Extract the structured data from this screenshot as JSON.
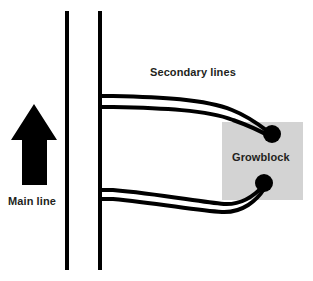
{
  "diagram": {
    "background_color": "#ffffff",
    "line_color": "#000000",
    "text_color": "#231f20",
    "labels": {
      "main_line": "Main line",
      "secondary_lines": "Secondary lines",
      "growblock": "Growblock"
    },
    "growblock": {
      "label": "Growblock",
      "fill_color": "#d3d3d3",
      "x": 222,
      "y": 122,
      "width": 81,
      "height": 78
    },
    "flow_arrow": {
      "direction": "up",
      "color": "#000000",
      "apex_x": 34,
      "apex_y": 104,
      "base_y": 185
    },
    "main_lines": [
      {
        "name": "main-line-left",
        "x": 67,
        "y_top": 11,
        "y_bottom": 270
      },
      {
        "name": "main-line-right",
        "x": 100,
        "y_top": 11,
        "y_bottom": 270
      }
    ],
    "secondary_lines": [
      {
        "name": "secondary-line-upper-outer",
        "branch_y": 96,
        "emitter": "emitter-upper"
      },
      {
        "name": "secondary-line-upper-inner",
        "branch_y": 107,
        "emitter": "emitter-upper"
      },
      {
        "name": "secondary-line-lower-outer",
        "branch_y": 190,
        "emitter": "emitter-lower"
      },
      {
        "name": "secondary-line-lower-inner",
        "branch_y": 199,
        "emitter": "emitter-lower"
      }
    ],
    "emitters": [
      {
        "name": "emitter-upper",
        "cx": 272,
        "cy": 134,
        "r": 9
      },
      {
        "name": "emitter-lower",
        "cx": 264,
        "cy": 183,
        "r": 9
      }
    ],
    "label_positions": {
      "main_line": {
        "x": 8,
        "y": 205
      },
      "secondary_lines": {
        "x": 150,
        "y": 76
      },
      "growblock": {
        "x": 232,
        "y": 161
      }
    }
  }
}
